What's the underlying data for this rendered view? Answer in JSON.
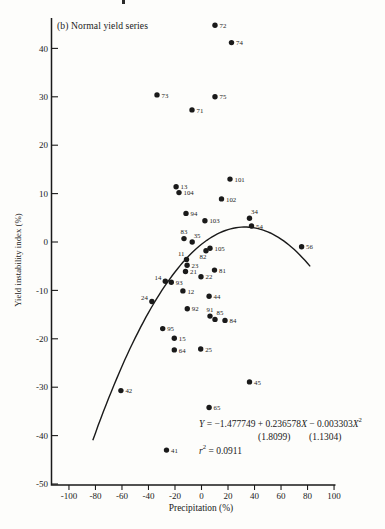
{
  "figure": {
    "background_color": "#fdfdfb",
    "ink_color": "#1a1a1a"
  },
  "chart_data": {
    "type": "scatter",
    "title": "(b) Normal yield series",
    "xlabel": "Precipitation (%)",
    "ylabel": "Yield instability index (%)",
    "xlim": [
      -113,
      101
    ],
    "ylim": [
      -50,
      46
    ],
    "x_ticks": [
      -100,
      -80,
      -60,
      -40,
      -20,
      0,
      20,
      40,
      60,
      80,
      100
    ],
    "y_ticks": [
      40,
      30,
      20,
      10,
      0,
      -10,
      -20,
      -30,
      -40,
      -50
    ],
    "grid": false,
    "legend": "none",
    "points": [
      {
        "label": "72",
        "x": 10.2,
        "y": 44.8,
        "label_pos": "r"
      },
      {
        "label": "74",
        "x": 22.6,
        "y": 41.2,
        "label_pos": "r"
      },
      {
        "label": "73",
        "x": -33.6,
        "y": 30.4,
        "label_pos": "r"
      },
      {
        "label": "75",
        "x": 10.2,
        "y": 30.0,
        "label_pos": "r"
      },
      {
        "label": "71",
        "x": -7.2,
        "y": 27.3,
        "label_pos": "r"
      },
      {
        "label": "101",
        "x": 21.5,
        "y": 13.0,
        "label_pos": "r"
      },
      {
        "label": "13",
        "x": -19.2,
        "y": 11.4,
        "label_pos": "r"
      },
      {
        "label": "104",
        "x": -17.0,
        "y": 10.2,
        "label_pos": "r"
      },
      {
        "label": "102",
        "x": 15.1,
        "y": 8.9,
        "label_pos": "r"
      },
      {
        "label": "94",
        "x": -11.7,
        "y": 5.9,
        "label_pos": "r"
      },
      {
        "label": "103",
        "x": 2.6,
        "y": 4.4,
        "label_pos": "r"
      },
      {
        "label": "34",
        "x": 36.2,
        "y": 4.9,
        "label_pos": "tr"
      },
      {
        "label": "54",
        "x": 37.7,
        "y": 3.3,
        "label_pos": "r"
      },
      {
        "label": "56",
        "x": 75.5,
        "y": -1.0,
        "label_pos": "r"
      },
      {
        "label": "83",
        "x": -13.2,
        "y": 0.7,
        "label_pos": "t"
      },
      {
        "label": "35",
        "x": -7.0,
        "y": 0.0,
        "label_pos": "tr"
      },
      {
        "label": "105",
        "x": 6.4,
        "y": -1.3,
        "label_pos": "r"
      },
      {
        "label": "82",
        "x": 3.4,
        "y": -1.8,
        "label_pos": "b"
      },
      {
        "label": "11",
        "x": -11.3,
        "y": -3.6,
        "label_pos": "tl"
      },
      {
        "label": "23",
        "x": -10.9,
        "y": -4.8,
        "label_pos": "r"
      },
      {
        "label": "21",
        "x": -12.1,
        "y": -6.1,
        "label_pos": "r"
      },
      {
        "label": "81",
        "x": 9.8,
        "y": -5.8,
        "label_pos": "r"
      },
      {
        "label": "22",
        "x": -0.4,
        "y": -7.2,
        "label_pos": "r"
      },
      {
        "label": "14",
        "x": -27.3,
        "y": -8.1,
        "label_pos": "l"
      },
      {
        "label": "93",
        "x": -22.8,
        "y": -8.3,
        "label_pos": "r"
      },
      {
        "label": "12",
        "x": -14.0,
        "y": -10.1,
        "label_pos": "r"
      },
      {
        "label": "44",
        "x": 5.7,
        "y": -11.2,
        "label_pos": "r"
      },
      {
        "label": "24",
        "x": -37.4,
        "y": -12.3,
        "label_pos": "l"
      },
      {
        "label": "92",
        "x": -10.7,
        "y": -13.8,
        "label_pos": "r"
      },
      {
        "label": "91",
        "x": 6.4,
        "y": -15.3,
        "label_pos": "t"
      },
      {
        "label": "85",
        "x": 10.2,
        "y": -16.0,
        "label_pos": "tr"
      },
      {
        "label": "84",
        "x": 17.7,
        "y": -16.2,
        "label_pos": "r"
      },
      {
        "label": "95",
        "x": -29.3,
        "y": -17.9,
        "label_pos": "r"
      },
      {
        "label": "15",
        "x": -20.5,
        "y": -19.9,
        "label_pos": "r"
      },
      {
        "label": "64",
        "x": -20.5,
        "y": -22.3,
        "label_pos": "r"
      },
      {
        "label": "25",
        "x": -0.6,
        "y": -22.1,
        "label_pos": "r"
      },
      {
        "label": "45",
        "x": 36.2,
        "y": -28.9,
        "label_pos": "r"
      },
      {
        "label": "42",
        "x": -60.8,
        "y": -30.7,
        "label_pos": "r"
      },
      {
        "label": "65",
        "x": 5.7,
        "y": -34.2,
        "label_pos": "r"
      },
      {
        "label": "41",
        "x": -26.4,
        "y": -43.0,
        "label_pos": "r"
      }
    ],
    "curve": {
      "type": "quadratic",
      "coefficients": {
        "c0": -0.48,
        "c1": 0.219,
        "c2": -0.00335
      },
      "x_range": [
        -82,
        82
      ]
    },
    "annotations": {
      "equation_parts": [
        {
          "t": "Y",
          "i": true
        },
        {
          "t": " = −1.477749 + 0.236578"
        },
        {
          "t": "X",
          "i": true
        },
        {
          "t": " − 0.003303"
        },
        {
          "t": "X",
          "i": true
        },
        {
          "t": "2",
          "sup": true
        }
      ],
      "se_values": [
        "(1.8099)",
        "(1.1304)"
      ],
      "r_squared_parts": [
        {
          "t": "r",
          "i": true
        },
        {
          "t": "2",
          "sup": true
        },
        {
          "t": " = 0.0911"
        }
      ]
    }
  }
}
